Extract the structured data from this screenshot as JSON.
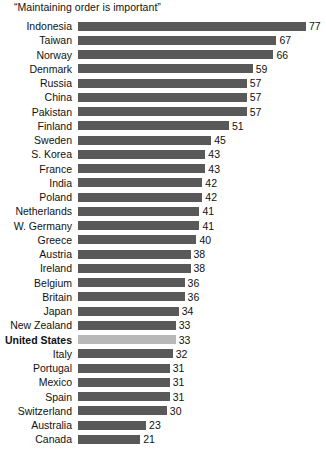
{
  "chart_data": {
    "type": "bar",
    "title": "“Maintaining order is important”",
    "xlabel": "",
    "ylabel": "",
    "orientation": "horizontal",
    "grid": false,
    "legend": null,
    "xlim": [
      0,
      77
    ],
    "value_suffix": "",
    "categories": [
      "Indonesia",
      "Taiwan",
      "Norway",
      "Denmark",
      "Russia",
      "China",
      "Pakistan",
      "Finland",
      "Sweden",
      "S. Korea",
      "France",
      "India",
      "Poland",
      "Netherlands",
      "W. Germany",
      "Greece",
      "Austria",
      "Ireland",
      "Belgium",
      "Britain",
      "Japan",
      "New Zealand",
      "United States",
      "Italy",
      "Portugal",
      "Mexico",
      "Spain",
      "Switzerland",
      "Australia",
      "Canada"
    ],
    "values": [
      77,
      67,
      66,
      59,
      57,
      57,
      57,
      51,
      45,
      43,
      43,
      42,
      42,
      41,
      41,
      40,
      38,
      38,
      36,
      36,
      34,
      33,
      33,
      32,
      31,
      31,
      31,
      30,
      23,
      21
    ],
    "highlighted_category": "United States",
    "colors": {
      "bar": "#595959",
      "bar_highlight": "#b8b8b8",
      "text": "#111111",
      "background": "#ffffff"
    }
  },
  "rows": [
    {
      "label": "Indonesia",
      "value": 77,
      "highlight": false
    },
    {
      "label": "Taiwan",
      "value": 67,
      "highlight": false
    },
    {
      "label": "Norway",
      "value": 66,
      "highlight": false
    },
    {
      "label": "Denmark",
      "value": 59,
      "highlight": false
    },
    {
      "label": "Russia",
      "value": 57,
      "highlight": false
    },
    {
      "label": "China",
      "value": 57,
      "highlight": false
    },
    {
      "label": "Pakistan",
      "value": 57,
      "highlight": false
    },
    {
      "label": "Finland",
      "value": 51,
      "highlight": false
    },
    {
      "label": "Sweden",
      "value": 45,
      "highlight": false
    },
    {
      "label": "S. Korea",
      "value": 43,
      "highlight": false
    },
    {
      "label": "France",
      "value": 43,
      "highlight": false
    },
    {
      "label": "India",
      "value": 42,
      "highlight": false
    },
    {
      "label": "Poland",
      "value": 42,
      "highlight": false
    },
    {
      "label": "Netherlands",
      "value": 41,
      "highlight": false
    },
    {
      "label": "W. Germany",
      "value": 41,
      "highlight": false
    },
    {
      "label": "Greece",
      "value": 40,
      "highlight": false
    },
    {
      "label": "Austria",
      "value": 38,
      "highlight": false
    },
    {
      "label": "Ireland",
      "value": 38,
      "highlight": false
    },
    {
      "label": "Belgium",
      "value": 36,
      "highlight": false
    },
    {
      "label": "Britain",
      "value": 36,
      "highlight": false
    },
    {
      "label": "Japan",
      "value": 34,
      "highlight": false
    },
    {
      "label": "New Zealand",
      "value": 33,
      "highlight": false
    },
    {
      "label": "United States",
      "value": 33,
      "highlight": true
    },
    {
      "label": "Italy",
      "value": 32,
      "highlight": false
    },
    {
      "label": "Portugal",
      "value": 31,
      "highlight": false
    },
    {
      "label": "Mexico",
      "value": 31,
      "highlight": false
    },
    {
      "label": "Spain",
      "value": 31,
      "highlight": false
    },
    {
      "label": "Switzerland",
      "value": 30,
      "highlight": false
    },
    {
      "label": "Australia",
      "value": 23,
      "highlight": false
    },
    {
      "label": "Canada",
      "value": 21,
      "highlight": false
    }
  ]
}
